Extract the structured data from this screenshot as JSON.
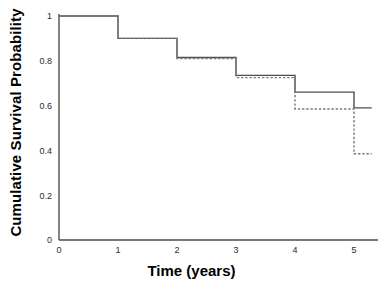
{
  "chart_data": {
    "type": "line",
    "title": "",
    "xlabel": "Time (years)",
    "ylabel": "Cumulative Survival Probability",
    "xlim": [
      0,
      5.3
    ],
    "ylim": [
      0,
      1.0
    ],
    "xticks": [
      "0",
      "1",
      "2",
      "3",
      "4",
      "5"
    ],
    "xtick_values": [
      0,
      1,
      2,
      3,
      4,
      5
    ],
    "yticks": [
      "0",
      "0.2",
      "0.4",
      "0.6",
      "0.8",
      "1"
    ],
    "ytick_values": [
      0,
      0.2,
      0.4,
      0.6,
      0.8,
      1
    ],
    "grid": false,
    "legend": "none",
    "step_style": "post",
    "series": [
      {
        "name": "solid-curve",
        "style": "solid",
        "color": "#4d4d4d",
        "x": [
          0,
          1,
          2,
          3,
          4,
          5,
          5.3
        ],
        "values": [
          1.0,
          0.9,
          0.815,
          0.735,
          0.66,
          0.59,
          0.59
        ]
      },
      {
        "name": "dashed-curve",
        "style": "dashed",
        "color": "#7a7a7a",
        "x": [
          0,
          1,
          2,
          3,
          4,
          5,
          5.3
        ],
        "values": [
          1.0,
          0.9,
          0.81,
          0.725,
          0.585,
          0.385,
          0.385
        ]
      }
    ],
    "axis_color": "#4d4d4d",
    "background": "#ffffff"
  }
}
